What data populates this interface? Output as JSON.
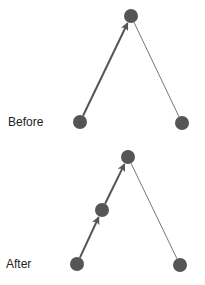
{
  "colors": {
    "node": "#555555",
    "arrow": "#555555",
    "edge": "#777777",
    "background": "#ffffff"
  },
  "panels": [
    {
      "label": "Before",
      "label_pos": [
        8,
        116
      ],
      "nodes": [
        {
          "id": "top",
          "x": 131,
          "y": 16,
          "r": 7
        },
        {
          "id": "bottom-left",
          "x": 80,
          "y": 122,
          "r": 7
        },
        {
          "id": "bottom-right",
          "x": 182,
          "y": 123,
          "r": 7
        }
      ],
      "edges": [
        {
          "from": "bottom-left",
          "to": "top",
          "arrow": true
        },
        {
          "from": "top",
          "to": "bottom-right",
          "arrow": false
        }
      ]
    },
    {
      "label": "After",
      "label_pos": [
        6,
        258
      ],
      "nodes": [
        {
          "id": "top",
          "x": 128,
          "y": 157,
          "r": 7
        },
        {
          "id": "middle",
          "x": 102,
          "y": 210,
          "r": 7
        },
        {
          "id": "bottom-left",
          "x": 77,
          "y": 264,
          "r": 7
        },
        {
          "id": "bottom-right",
          "x": 180,
          "y": 265,
          "r": 7
        }
      ],
      "edges": [
        {
          "from": "bottom-left",
          "to": "middle",
          "arrow": true
        },
        {
          "from": "middle",
          "to": "top",
          "arrow": true
        },
        {
          "from": "top",
          "to": "bottom-right",
          "arrow": false
        }
      ]
    }
  ]
}
